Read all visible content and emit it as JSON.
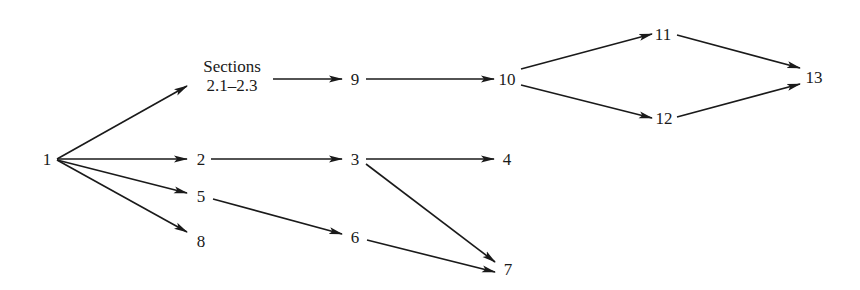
{
  "diagram": {
    "type": "directed-graph",
    "nodes": [
      {
        "id": "1",
        "label": "1",
        "x": 47,
        "y": 159
      },
      {
        "id": "S",
        "label": "Sections",
        "label2": "2.1–2.3",
        "x": 232,
        "y": 79
      },
      {
        "id": "2",
        "label": "2",
        "x": 201,
        "y": 159
      },
      {
        "id": "5",
        "label": "5",
        "x": 201,
        "y": 196
      },
      {
        "id": "8",
        "label": "8",
        "x": 201,
        "y": 241
      },
      {
        "id": "9",
        "label": "9",
        "x": 355,
        "y": 79
      },
      {
        "id": "3",
        "label": "3",
        "x": 355,
        "y": 159
      },
      {
        "id": "6",
        "label": "6",
        "x": 355,
        "y": 237
      },
      {
        "id": "10",
        "label": "10",
        "x": 507,
        "y": 79
      },
      {
        "id": "4",
        "label": "4",
        "x": 507,
        "y": 159
      },
      {
        "id": "7",
        "label": "7",
        "x": 508,
        "y": 269
      },
      {
        "id": "11",
        "label": "11",
        "x": 663,
        "y": 34
      },
      {
        "id": "12",
        "label": "12",
        "x": 664,
        "y": 118
      },
      {
        "id": "13",
        "label": "13",
        "x": 814,
        "y": 77
      }
    ],
    "edges": [
      {
        "from": "1",
        "to": "S"
      },
      {
        "from": "1",
        "to": "2"
      },
      {
        "from": "1",
        "to": "5"
      },
      {
        "from": "1",
        "to": "8"
      },
      {
        "from": "S",
        "to": "9"
      },
      {
        "from": "9",
        "to": "10"
      },
      {
        "from": "10",
        "to": "11"
      },
      {
        "from": "10",
        "to": "12"
      },
      {
        "from": "11",
        "to": "13"
      },
      {
        "from": "12",
        "to": "13"
      },
      {
        "from": "2",
        "to": "3"
      },
      {
        "from": "3",
        "to": "4"
      },
      {
        "from": "3",
        "to": "7"
      },
      {
        "from": "5",
        "to": "6"
      },
      {
        "from": "6",
        "to": "7"
      }
    ]
  }
}
